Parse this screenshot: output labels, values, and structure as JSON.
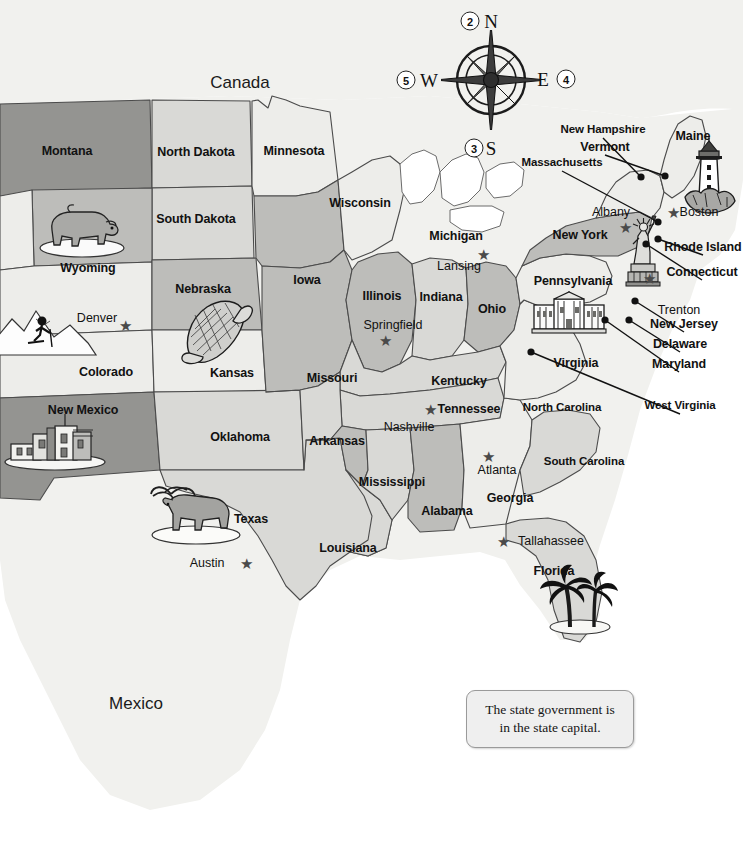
{
  "map": {
    "title": "United States political map with state capitals",
    "countries": [
      {
        "name": "Canada",
        "x": 240,
        "y": 82
      },
      {
        "name": "Mexico",
        "x": 136,
        "y": 703
      }
    ],
    "compass": {
      "north_label": "N",
      "south_label": "S",
      "east_label": "E",
      "west_label": "W",
      "callouts": [
        {
          "number": "2",
          "x": 470,
          "y": 21,
          "points_to": "N"
        },
        {
          "number": "4",
          "x": 566,
          "y": 79,
          "points_to": "E"
        },
        {
          "number": "3",
          "x": 474,
          "y": 148,
          "points_to": "S"
        },
        {
          "number": "5",
          "x": 406,
          "y": 80,
          "points_to": "W"
        }
      ],
      "center_x": 491,
      "center_y": 80
    },
    "legend": {
      "line1": "The state government is",
      "line2": "in the state capital."
    },
    "states": [
      {
        "name": "Montana",
        "x": 67,
        "y": 151,
        "shade": "dark"
      },
      {
        "name": "North Dakota",
        "x": 196,
        "y": 152,
        "shade": "light"
      },
      {
        "name": "Minnesota",
        "x": 294,
        "y": 151,
        "shade": "pale"
      },
      {
        "name": "South Dakota",
        "x": 196,
        "y": 219,
        "shade": "light"
      },
      {
        "name": "Wisconsin",
        "x": 360,
        "y": 203,
        "shade": "pale"
      },
      {
        "name": "Wyoming",
        "x": 88,
        "y": 268,
        "shade": "mid"
      },
      {
        "name": "Nebraska",
        "x": 203,
        "y": 289,
        "shade": "mid"
      },
      {
        "name": "Iowa",
        "x": 307,
        "y": 280,
        "shade": "mid"
      },
      {
        "name": "Michigan",
        "x": 456,
        "y": 236,
        "shade": "pale"
      },
      {
        "name": "Colorado",
        "x": 106,
        "y": 372,
        "shade": "pale"
      },
      {
        "name": "Kansas",
        "x": 232,
        "y": 373,
        "shade": "pale"
      },
      {
        "name": "Missouri",
        "x": 332,
        "y": 378,
        "shade": "light"
      },
      {
        "name": "Illinois",
        "x": 382,
        "y": 296,
        "shade": "mid"
      },
      {
        "name": "Indiana",
        "x": 441,
        "y": 297,
        "shade": "light"
      },
      {
        "name": "Ohio",
        "x": 492,
        "y": 309,
        "shade": "mid"
      },
      {
        "name": "Kentucky",
        "x": 459,
        "y": 381,
        "shade": "light"
      },
      {
        "name": "Tennessee",
        "x": 469,
        "y": 409,
        "shade": "light"
      },
      {
        "name": "New Mexico",
        "x": 83,
        "y": 410,
        "shade": "dark"
      },
      {
        "name": "Oklahoma",
        "x": 240,
        "y": 437,
        "shade": "light"
      },
      {
        "name": "Arkansas",
        "x": 337,
        "y": 441,
        "shade": "mid"
      },
      {
        "name": "Texas",
        "x": 251,
        "y": 519,
        "shade": "light"
      },
      {
        "name": "Louisiana",
        "x": 348,
        "y": 548,
        "shade": "light"
      },
      {
        "name": "Mississippi",
        "x": 392,
        "y": 482,
        "shade": "mid"
      },
      {
        "name": "Alabama",
        "x": 447,
        "y": 511,
        "shade": "mid"
      },
      {
        "name": "Georgia",
        "x": 510,
        "y": 498,
        "shade": "pale"
      },
      {
        "name": "Florida",
        "x": 554,
        "y": 571,
        "shade": "light"
      },
      {
        "name": "South Carolina",
        "x": 584,
        "y": 462,
        "shade": "light"
      },
      {
        "name": "North Carolina",
        "x": 562,
        "y": 408,
        "shade": "mid"
      },
      {
        "name": "Virginia",
        "x": 576,
        "y": 363,
        "shade": "pale"
      },
      {
        "name": "Pennsylvania",
        "x": 573,
        "y": 281,
        "shade": "pale"
      },
      {
        "name": "New York",
        "x": 580,
        "y": 235,
        "shade": "mid"
      },
      {
        "name": "Maine",
        "x": 693,
        "y": 136,
        "shade": "pale"
      }
    ],
    "callout_states": [
      {
        "name": "New Hampshire",
        "label_x": 603,
        "label_y": 130,
        "dot_x": 641,
        "dot_y": 177
      },
      {
        "name": "Vermont",
        "label_x": 605,
        "label_y": 147,
        "dot_x": 665,
        "dot_y": 176
      },
      {
        "name": "Massachusetts",
        "label_x": 562,
        "label_y": 163,
        "dot_x": 658,
        "dot_y": 222
      },
      {
        "name": "Rhode Island",
        "label_x": 703,
        "label_y": 247,
        "dot_x": 658,
        "dot_y": 239
      },
      {
        "name": "Connecticut",
        "label_x": 702,
        "label_y": 272,
        "dot_x": 646,
        "dot_y": 244
      },
      {
        "name": "New Jersey",
        "label_x": 684,
        "label_y": 324,
        "dot_x": 635,
        "dot_y": 301
      },
      {
        "name": "Delaware",
        "label_x": 680,
        "label_y": 344,
        "dot_x": 629,
        "dot_y": 320
      },
      {
        "name": "Maryland",
        "label_x": 679,
        "label_y": 364,
        "dot_x": 605,
        "dot_y": 320
      },
      {
        "name": "West Virginia",
        "label_x": 680,
        "label_y": 406,
        "dot_x": 531,
        "dot_y": 352
      }
    ],
    "cities": [
      {
        "name": "Denver",
        "label_x": 97,
        "label_y": 318,
        "star_x": 125,
        "star_y": 325,
        "has_star": true
      },
      {
        "name": "Austin",
        "label_x": 207,
        "label_y": 563,
        "star_x": 246,
        "star_y": 563,
        "has_star": true
      },
      {
        "name": "Springfield",
        "label_x": 393,
        "label_y": 325,
        "star_x": 385,
        "star_y": 340,
        "has_star": true
      },
      {
        "name": "Lansing",
        "label_x": 459,
        "label_y": 266,
        "star_x": 483,
        "star_y": 254,
        "has_star": true
      },
      {
        "name": "Nashville",
        "label_x": 409,
        "label_y": 427,
        "star_x": 430,
        "star_y": 409,
        "has_star": true
      },
      {
        "name": "Atlanta",
        "label_x": 497,
        "label_y": 470,
        "star_x": 488,
        "star_y": 456,
        "has_star": true
      },
      {
        "name": "Tallahassee",
        "label_x": 551,
        "label_y": 541,
        "star_x": 503,
        "star_y": 541,
        "has_star": true
      },
      {
        "name": "Albany",
        "label_x": 611,
        "label_y": 212,
        "star_x": 625,
        "star_y": 227,
        "has_star": true
      },
      {
        "name": "Boston",
        "label_x": 699,
        "label_y": 212,
        "star_x": 673,
        "star_y": 212,
        "has_star": true
      },
      {
        "name": "Trenton",
        "label_x": 679,
        "label_y": 310,
        "star_x": 649,
        "star_y": 278,
        "has_star": true
      }
    ],
    "illustrations": [
      {
        "name": "bison-illustration",
        "state": "Wyoming",
        "x": 82,
        "y": 231
      },
      {
        "name": "skier-illustration",
        "state": "Colorado",
        "x": 47,
        "y": 330
      },
      {
        "name": "corn-illustration",
        "state": "Kansas",
        "x": 216,
        "y": 333
      },
      {
        "name": "adobe-pueblo-illustration",
        "state": "New Mexico",
        "x": 55,
        "y": 444
      },
      {
        "name": "longhorn-steer-illustration",
        "state": "Texas",
        "x": 196,
        "y": 515
      },
      {
        "name": "palm-trees-illustration",
        "state": "Florida",
        "x": 580,
        "y": 601
      },
      {
        "name": "white-house-illustration",
        "state": "Maryland",
        "x": 569,
        "y": 316
      },
      {
        "name": "statue-of-liberty-illustration",
        "state": "New York",
        "x": 644,
        "y": 252
      },
      {
        "name": "lighthouse-illustration",
        "state": "Maine",
        "x": 709,
        "y": 180
      }
    ],
    "colors": {
      "pale": "#ededea",
      "light": "#d9d9d6",
      "mid": "#bdbdba",
      "dark": "#949491",
      "water": "#ffffff",
      "outline": "#4b4b4b",
      "background": "#f1f1ee",
      "text": "#111111"
    }
  }
}
